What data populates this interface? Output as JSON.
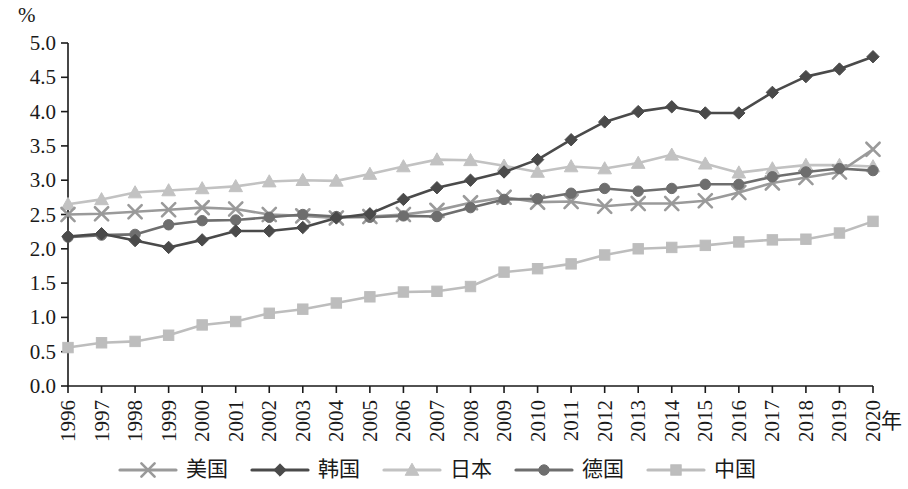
{
  "chart_data": {
    "type": "line",
    "title": "",
    "xlabel": "年",
    "ylabel": "%",
    "ylim": [
      0.0,
      5.0
    ],
    "ytick_step": 0.5,
    "grid": false,
    "legend_position": "bottom",
    "x": [
      1996,
      1997,
      1998,
      1999,
      2000,
      2001,
      2002,
      2003,
      2004,
      2005,
      2006,
      2007,
      2008,
      2009,
      2010,
      2011,
      2012,
      2013,
      2014,
      2015,
      2016,
      2017,
      2018,
      2019,
      2020
    ],
    "ytick_labels": [
      "0.0",
      "0.5",
      "1.0",
      "1.5",
      "2.0",
      "2.5",
      "3.0",
      "3.5",
      "4.0",
      "4.5",
      "5.0"
    ],
    "xtick_labels": [
      "1996",
      "1997",
      "1998",
      "1999",
      "2000",
      "2001",
      "2002",
      "2003",
      "2004",
      "2005",
      "2006",
      "2007",
      "2008",
      "2009",
      "2010",
      "2011",
      "2012",
      "2013",
      "2014",
      "2015",
      "2016",
      "2017",
      "2018",
      "2019",
      "2020"
    ],
    "series": [
      {
        "name": "美国",
        "marker": "cross",
        "color": "#9a9a9a",
        "values": [
          2.5,
          2.51,
          2.54,
          2.57,
          2.6,
          2.58,
          2.5,
          2.48,
          2.45,
          2.47,
          2.5,
          2.56,
          2.67,
          2.75,
          2.68,
          2.69,
          2.62,
          2.66,
          2.66,
          2.7,
          2.82,
          2.96,
          3.04,
          3.12,
          3.45
        ]
      },
      {
        "name": "韩国",
        "marker": "diamond",
        "color": "#4a4a4a",
        "values": [
          2.18,
          2.22,
          2.12,
          2.02,
          2.13,
          2.26,
          2.26,
          2.31,
          2.45,
          2.51,
          2.72,
          2.89,
          3.0,
          3.12,
          3.3,
          3.59,
          3.85,
          4.0,
          4.07,
          3.98,
          3.98,
          4.28,
          4.51,
          4.62,
          4.8
        ]
      },
      {
        "name": "日本",
        "marker": "triangle",
        "color": "#c2c2c2",
        "values": [
          2.65,
          2.72,
          2.82,
          2.85,
          2.88,
          2.91,
          2.98,
          3.0,
          2.99,
          3.09,
          3.2,
          3.3,
          3.29,
          3.21,
          3.12,
          3.2,
          3.17,
          3.25,
          3.37,
          3.24,
          3.11,
          3.17,
          3.22,
          3.22,
          3.2
        ]
      },
      {
        "name": "德国",
        "marker": "circle",
        "color": "#6e6e6e",
        "values": [
          2.17,
          2.2,
          2.21,
          2.35,
          2.41,
          2.42,
          2.46,
          2.5,
          2.47,
          2.46,
          2.48,
          2.47,
          2.6,
          2.72,
          2.73,
          2.81,
          2.88,
          2.84,
          2.88,
          2.94,
          2.94,
          3.05,
          3.12,
          3.17,
          3.14
        ]
      },
      {
        "name": "中国",
        "marker": "square",
        "color": "#bdbdbd",
        "values": [
          0.56,
          0.63,
          0.65,
          0.74,
          0.89,
          0.94,
          1.06,
          1.12,
          1.21,
          1.3,
          1.37,
          1.38,
          1.45,
          1.66,
          1.71,
          1.78,
          1.91,
          2.0,
          2.02,
          2.05,
          2.1,
          2.13,
          2.14,
          2.23,
          2.4
        ]
      }
    ]
  },
  "legend": {
    "items": [
      {
        "label": "美国",
        "marker": "cross",
        "color": "#9a9a9a"
      },
      {
        "label": "韩国",
        "marker": "diamond",
        "color": "#4a4a4a"
      },
      {
        "label": "日本",
        "marker": "triangle",
        "color": "#c2c2c2"
      },
      {
        "label": "德国",
        "marker": "circle",
        "color": "#6e6e6e"
      },
      {
        "label": "中国",
        "marker": "square",
        "color": "#bdbdbd"
      }
    ]
  }
}
